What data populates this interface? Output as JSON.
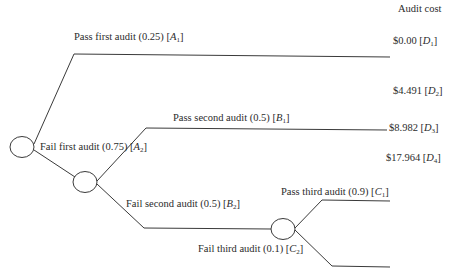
{
  "header": {
    "column_title": "Audit cost"
  },
  "nodes": [
    {
      "id": "root",
      "type": "chance",
      "cx": 22,
      "cy": 147
    },
    {
      "id": "n2",
      "type": "chance",
      "cx": 85,
      "cy": 182
    },
    {
      "id": "n3",
      "type": "chance",
      "cx": 283,
      "cy": 229
    }
  ],
  "branches": {
    "A1": {
      "text": "Pass first audit (0.25) [",
      "var": "A",
      "sub": "1",
      "close": "]",
      "event": "Pass first audit",
      "probability": 0.25
    },
    "A2": {
      "text": "Fail first audit (0.75) [",
      "var": "A",
      "sub": "2",
      "close": "]",
      "event": "Fail first audit",
      "probability": 0.75
    },
    "B1": {
      "text": "Pass second audit (0.5) [",
      "var": "B",
      "sub": "1",
      "close": "]",
      "event": "Pass second audit",
      "probability": 0.5
    },
    "B2": {
      "text": "Fail second audit (0.5) [",
      "var": "B",
      "sub": "2",
      "close": "]",
      "event": "Fail second audit",
      "probability": 0.5
    },
    "C1": {
      "text": "Pass third audit (0.9) [",
      "var": "C",
      "sub": "1",
      "close": "]",
      "event": "Pass third audit",
      "probability": 0.9
    },
    "C2": {
      "text": "Fail third audit (0.1) [",
      "var": "C",
      "sub": "2",
      "close": "]",
      "event": "Fail third audit",
      "probability": 0.1
    }
  },
  "costs": {
    "D1": {
      "text": "$0.00 [",
      "var": "D",
      "sub": "1",
      "close": "]",
      "value": 0.0
    },
    "D2": {
      "text": "$4.491 [",
      "var": "D",
      "sub": "2",
      "close": "]",
      "value": 4.491
    },
    "D3": {
      "text": "$8.982 [",
      "var": "D",
      "sub": "3",
      "close": "]",
      "value": 8.982
    },
    "D4": {
      "text": "$17.964 [",
      "var": "D",
      "sub": "4",
      "close": "]",
      "value": 17.964
    }
  },
  "style": {
    "line_color": "#3a3a3a",
    "text_color": "#2b2b2b"
  }
}
